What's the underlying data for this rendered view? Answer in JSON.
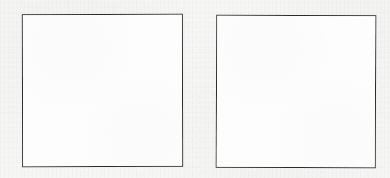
{
  "page": {
    "kind": "scanned-document-page",
    "width": 390,
    "height": 178,
    "background_color": "#f5f5f5",
    "ink_color": "#2b2b2b"
  },
  "boxes": [
    {
      "name": "left-empty-box",
      "label": "",
      "content": "",
      "fill_color": "#fcfcfc",
      "border_color": "#2b2b2b",
      "x": 22,
      "y": 14,
      "width": 161,
      "height": 153
    },
    {
      "name": "right-empty-box",
      "label": "",
      "content": "",
      "fill_color": "#fcfcfc",
      "border_color": "#2b2b2b",
      "x": 216,
      "y": 15,
      "width": 160,
      "height": 153
    }
  ],
  "ghost_text": {
    "visible_text": "",
    "note": ""
  }
}
